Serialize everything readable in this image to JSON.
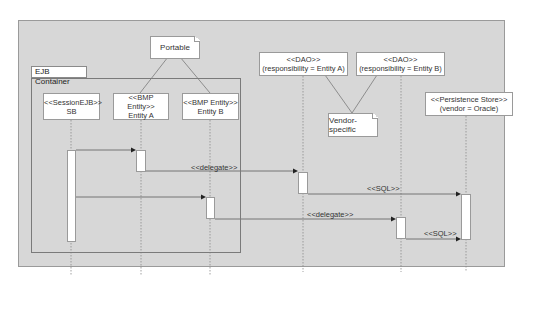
{
  "diagram": {
    "type": "UML sequence diagram",
    "container": {
      "label": "EJB Container"
    },
    "notes": [
      {
        "id": "portable",
        "label": "Portable"
      },
      {
        "id": "vendor",
        "label": "Vendor-specific"
      }
    ],
    "lifelines": [
      {
        "id": "sb",
        "stereotype": "<<SessionEJB>>",
        "name": "SB"
      },
      {
        "id": "entityA",
        "stereotype": "<<BMP Entity>>",
        "name": "Entity A"
      },
      {
        "id": "entityB",
        "stereotype": "<<BMP Entity>>",
        "name": "Entity B"
      },
      {
        "id": "daoA",
        "stereotype": "<<DAO>>",
        "name": "(responsibility = Entity A)"
      },
      {
        "id": "daoB",
        "stereotype": "<<DAO>>",
        "name": "(responsibility = Entity B)"
      },
      {
        "id": "store",
        "stereotype": "<<Persistence Store>>",
        "name": "(vendor = Oracle)"
      }
    ],
    "messages": [
      {
        "from": "sb",
        "to": "entityA",
        "label": ""
      },
      {
        "from": "entityA",
        "to": "daoA",
        "label": "<<delegate>>"
      },
      {
        "from": "daoA",
        "to": "store",
        "label": "<<SQL>>"
      },
      {
        "from": "sb",
        "to": "entityB",
        "label": ""
      },
      {
        "from": "entityB",
        "to": "daoB",
        "label": "<<delegate>>"
      },
      {
        "from": "daoB",
        "to": "store",
        "label": "<<SQL>>"
      }
    ],
    "colors": {
      "background": "#d7d7d7",
      "box_fill": "#ffffff",
      "line": "#7a7a7a",
      "text": "#333333"
    }
  }
}
